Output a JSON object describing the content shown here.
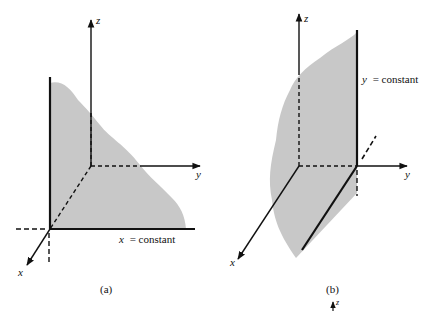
{
  "figure_a": {
    "caption": "(a)",
    "axis_x": "x",
    "axis_y": "y",
    "axis_z": "z",
    "plane_label_var": "x",
    "plane_label_rest": "= constant"
  },
  "figure_b": {
    "caption": "(b)",
    "axis_x": "x",
    "axis_y": "y",
    "axis_z": "z",
    "plane_label_var": "y",
    "plane_label_rest": "= constant"
  },
  "figure_c_partial": {
    "axis_z": "z"
  },
  "colors": {
    "plane_fill": "#c8c8c8",
    "ink": "#111111"
  }
}
